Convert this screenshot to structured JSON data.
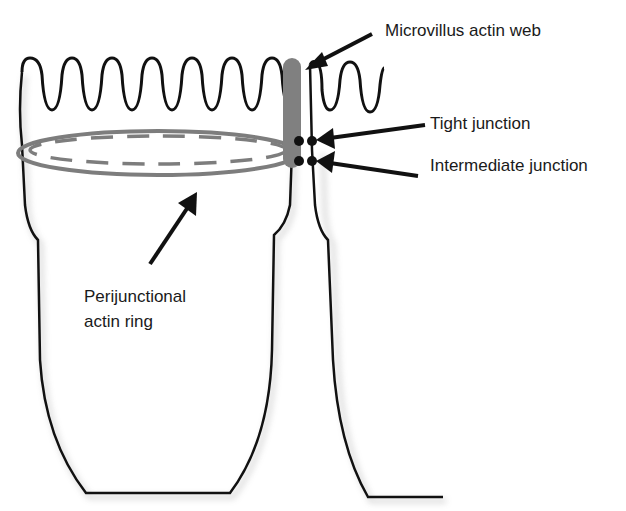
{
  "labels": {
    "microvillus": "Microvillus actin web",
    "tight": "Tight junction",
    "intermediate": "Intermediate junction",
    "ring_line1": "Perijunctional",
    "ring_line2": "actin ring"
  },
  "colors": {
    "outline": "#111111",
    "actin": "#7d7d7d",
    "shadow": "#cfcfcf"
  }
}
